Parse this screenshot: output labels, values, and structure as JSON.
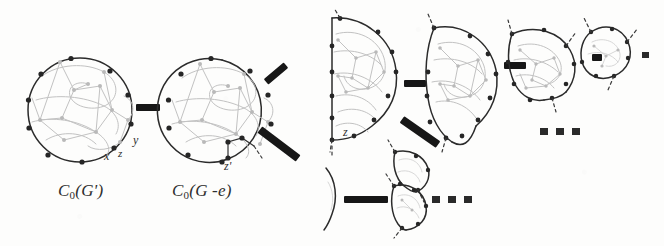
{
  "figure": {
    "kind": "mathematical-diagram",
    "background_color": "#fdfdfc",
    "ink_color": "#2b2b2b",
    "faint_graph_color": "#bdbdbd",
    "vertex_color": "#272727",
    "arrow_color": "#1f1f1f"
  },
  "captions": [
    {
      "name": "caption-c0-g-prime",
      "head": "C",
      "sub": "0",
      "open": "(",
      "body": "G",
      "prime": "'",
      "close": ")",
      "text": "C0(G')"
    },
    {
      "name": "caption-c0-g-minus-e",
      "head": "C",
      "sub": "0",
      "open": "(",
      "body": "G -e",
      "prime": "",
      "close": ")",
      "text": "C0(G -e)"
    }
  ],
  "vertex_labels": [
    {
      "name": "label-x",
      "text": "x"
    },
    {
      "name": "label-y",
      "text": "y"
    },
    {
      "name": "label-z-first",
      "text": "z"
    },
    {
      "name": "label-z-prime",
      "text": "z'"
    },
    {
      "name": "label-z-third",
      "text": "z"
    }
  ],
  "ellipses": [
    {
      "name": "ellipsis-top-right",
      "text": "..."
    },
    {
      "name": "ellipsis-bottom-right",
      "text": "..."
    }
  ],
  "arrows": [
    {
      "name": "arrow-1-horizontal",
      "direction": "right"
    },
    {
      "name": "arrow-2-diagonal-up",
      "direction": "up-right"
    },
    {
      "name": "arrow-3-diagonal-down",
      "direction": "down-right"
    },
    {
      "name": "arrow-4-horizontal",
      "direction": "right"
    },
    {
      "name": "arrow-5-horizontal",
      "direction": "right"
    },
    {
      "name": "arrow-6-diagonal-down",
      "direction": "down-right"
    },
    {
      "name": "arrow-7-horizontal",
      "direction": "right"
    },
    {
      "name": "arrow-8-horizontal-long",
      "direction": "right"
    }
  ],
  "shapes": [
    {
      "name": "sphere-1",
      "type": "circle",
      "caption": "C0(G')"
    },
    {
      "name": "sphere-2",
      "type": "circle",
      "caption": "C0(G -e)"
    },
    {
      "name": "disk-3",
      "type": "half-disk"
    },
    {
      "name": "disk-4",
      "type": "half-disk"
    },
    {
      "name": "disk-5",
      "type": "partial-disk"
    },
    {
      "name": "disk-6",
      "type": "small-blob"
    },
    {
      "name": "disk-7",
      "type": "small-wedge-upper"
    },
    {
      "name": "disk-8",
      "type": "small-wedge-lower"
    },
    {
      "name": "disk-9",
      "type": "small-leaf"
    }
  ]
}
